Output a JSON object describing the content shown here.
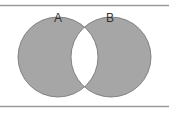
{
  "diagram": {
    "type": "venn",
    "sets": [
      {
        "label": "A",
        "cx": 58,
        "cy": 57,
        "r": 40
      },
      {
        "label": "B",
        "cx": 111,
        "cy": 57,
        "r": 40
      }
    ],
    "shaded_region": "symmetric difference (A XOR B)",
    "colors": {
      "fill": "#a6a6a6",
      "stroke": "#6f6f6f",
      "rule": "#9a9a9a",
      "background": "#ffffff"
    }
  }
}
